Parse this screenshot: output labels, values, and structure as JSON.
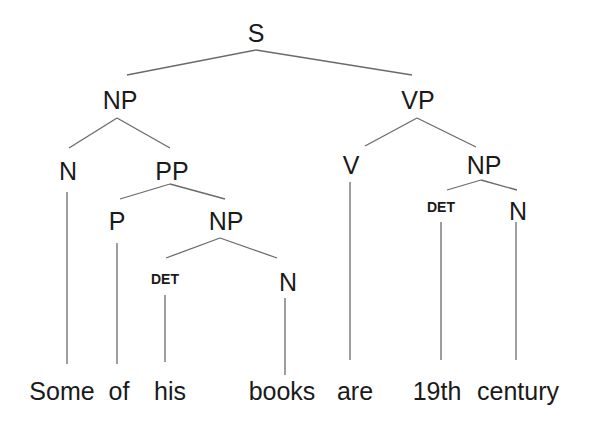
{
  "diagram": {
    "type": "syntax-tree",
    "sentence": "Some of his books are 19th century",
    "nodes": [
      {
        "id": "S",
        "label": "S",
        "x": 256,
        "y": 42,
        "size": "large"
      },
      {
        "id": "NP1",
        "label": "NP",
        "x": 120,
        "y": 109,
        "size": "large"
      },
      {
        "id": "VP",
        "label": "VP",
        "x": 418,
        "y": 109,
        "size": "large"
      },
      {
        "id": "N1",
        "label": "N",
        "x": 68,
        "y": 180,
        "size": "large"
      },
      {
        "id": "PP",
        "label": "PP",
        "x": 172,
        "y": 180,
        "size": "large"
      },
      {
        "id": "V",
        "label": "V",
        "x": 351,
        "y": 174,
        "size": "large"
      },
      {
        "id": "NP3",
        "label": "NP",
        "x": 484,
        "y": 174,
        "size": "large"
      },
      {
        "id": "P",
        "label": "P",
        "x": 117,
        "y": 230,
        "size": "large"
      },
      {
        "id": "NP2",
        "label": "NP",
        "x": 226,
        "y": 230,
        "size": "large"
      },
      {
        "id": "DET2",
        "label": "DET",
        "x": 441,
        "y": 212,
        "size": "small"
      },
      {
        "id": "N3",
        "label": "N",
        "x": 518,
        "y": 220,
        "size": "large"
      },
      {
        "id": "DET1",
        "label": "DET",
        "x": 165,
        "y": 284,
        "size": "small"
      },
      {
        "id": "N2",
        "label": "N",
        "x": 288,
        "y": 291,
        "size": "large"
      }
    ],
    "edges": [
      {
        "from": "S",
        "to": "NP1",
        "x1": 256,
        "y1": 50,
        "x2": 127,
        "y2": 75
      },
      {
        "from": "S",
        "to": "VP",
        "x1": 256,
        "y1": 50,
        "x2": 412,
        "y2": 75
      },
      {
        "from": "NP1",
        "to": "N1",
        "x1": 117,
        "y1": 118,
        "x2": 69,
        "y2": 148
      },
      {
        "from": "NP1",
        "to": "PP",
        "x1": 117,
        "y1": 118,
        "x2": 170,
        "y2": 148
      },
      {
        "from": "VP",
        "to": "V",
        "x1": 417,
        "y1": 118,
        "x2": 365,
        "y2": 146
      },
      {
        "from": "VP",
        "to": "NP3",
        "x1": 417,
        "y1": 118,
        "x2": 476,
        "y2": 147
      },
      {
        "from": "PP",
        "to": "P",
        "x1": 170,
        "y1": 184,
        "x2": 120,
        "y2": 199
      },
      {
        "from": "PP",
        "to": "NP2",
        "x1": 170,
        "y1": 184,
        "x2": 225,
        "y2": 199
      },
      {
        "from": "NP3",
        "to": "DET2",
        "x1": 481,
        "y1": 180,
        "x2": 447,
        "y2": 190
      },
      {
        "from": "NP3",
        "to": "N3",
        "x1": 481,
        "y1": 180,
        "x2": 517,
        "y2": 190
      },
      {
        "from": "NP2",
        "to": "DET1",
        "x1": 220,
        "y1": 238,
        "x2": 166,
        "y2": 258
      },
      {
        "from": "NP2",
        "to": "N2",
        "x1": 220,
        "y1": 238,
        "x2": 277,
        "y2": 258
      },
      {
        "from": "N1",
        "to": "w0",
        "x1": 67,
        "y1": 192,
        "x2": 67,
        "y2": 364
      },
      {
        "from": "P",
        "to": "w1",
        "x1": 117,
        "y1": 243,
        "x2": 117,
        "y2": 364
      },
      {
        "from": "DET1",
        "to": "w2",
        "x1": 165,
        "y1": 295,
        "x2": 165,
        "y2": 362
      },
      {
        "from": "N2",
        "to": "w3",
        "x1": 285,
        "y1": 298,
        "x2": 285,
        "y2": 375
      },
      {
        "from": "V",
        "to": "w4",
        "x1": 350,
        "y1": 182,
        "x2": 350,
        "y2": 360
      },
      {
        "from": "DET2",
        "to": "w5",
        "x1": 441,
        "y1": 222,
        "x2": 441,
        "y2": 360
      },
      {
        "from": "N3",
        "to": "w6",
        "x1": 516,
        "y1": 222,
        "x2": 516,
        "y2": 360
      }
    ],
    "words": [
      {
        "id": "w0",
        "text": "Some",
        "x": 62,
        "y": 400
      },
      {
        "id": "w1",
        "text": "of",
        "x": 119,
        "y": 400
      },
      {
        "id": "w2",
        "text": "his",
        "x": 170,
        "y": 400
      },
      {
        "id": "w3",
        "text": "books",
        "x": 282,
        "y": 400
      },
      {
        "id": "w4",
        "text": "are",
        "x": 355,
        "y": 400
      },
      {
        "id": "w5",
        "text": "19th",
        "x": 437,
        "y": 400
      },
      {
        "id": "w6",
        "text": "century",
        "x": 518,
        "y": 400
      }
    ]
  }
}
